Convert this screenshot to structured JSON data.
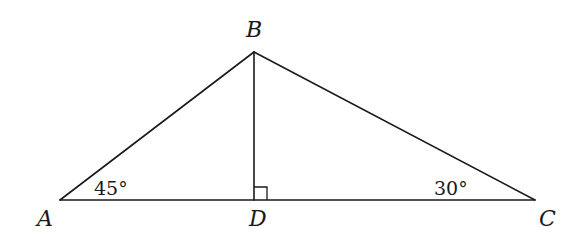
{
  "diagram": {
    "type": "triangle-with-altitude",
    "colors": {
      "stroke": "#1a1a1a",
      "background": "#ffffff"
    },
    "vertices": {
      "A": {
        "label": "A",
        "x": 60,
        "y": 200
      },
      "B": {
        "label": "B",
        "x": 254,
        "y": 52
      },
      "C": {
        "label": "C",
        "x": 535,
        "y": 200
      },
      "D": {
        "label": "D",
        "x": 254,
        "y": 200
      }
    },
    "segments": [
      "AB",
      "BC",
      "AC",
      "BD"
    ],
    "angles": {
      "A": {
        "label": "45°"
      },
      "C": {
        "label": "30°"
      },
      "D": {
        "label": "right-angle"
      }
    }
  }
}
